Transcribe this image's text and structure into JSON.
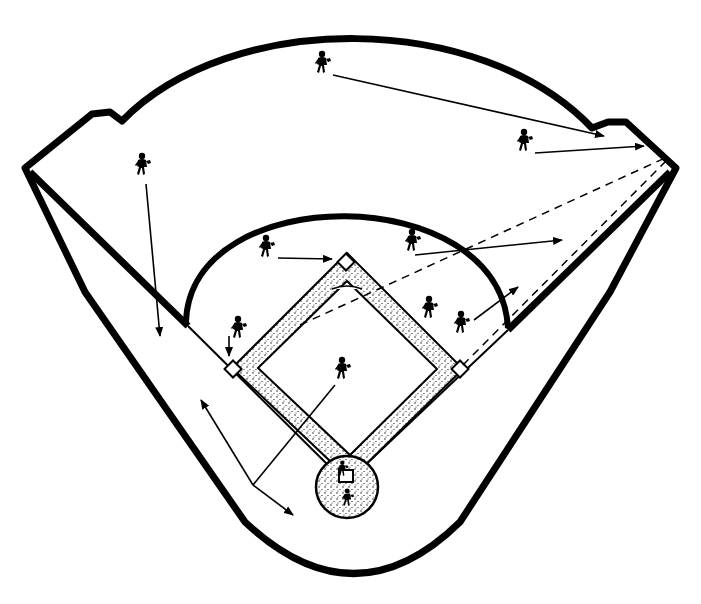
{
  "diagram": {
    "caption_fragment": "",
    "colors": {
      "ink": "#000000",
      "background": "#ffffff",
      "dirt_stipple": "#000000"
    }
  },
  "field": {
    "outfield_wall": "curved wall with notched corners at left and right field",
    "foul_lines": [
      "third-base line",
      "first-base line"
    ],
    "infield_arc": "grass/dirt boundary arc behind the bases",
    "bases": [
      "home plate",
      "first base",
      "second base",
      "third base"
    ],
    "pitchers_area": "stippled infield dirt with pitcher at center"
  },
  "players": [
    {
      "position": "center fielder",
      "x": 322,
      "y": 62
    },
    {
      "position": "right fielder",
      "x": 524,
      "y": 140
    },
    {
      "position": "left fielder",
      "x": 143,
      "y": 165
    },
    {
      "position": "shortstop",
      "x": 265,
      "y": 247
    },
    {
      "position": "second baseman",
      "x": 411,
      "y": 240
    },
    {
      "position": "third baseman",
      "x": 237,
      "y": 328
    },
    {
      "position": "runner",
      "x": 428,
      "y": 307
    },
    {
      "position": "first baseman",
      "x": 462,
      "y": 322
    },
    {
      "position": "pitcher",
      "x": 343,
      "y": 370
    },
    {
      "position": "catcher",
      "x": 343,
      "y": 465
    },
    {
      "position": "batter",
      "x": 347,
      "y": 497
    }
  ],
  "arrows": [
    {
      "from": "center fielder",
      "to": "right field corner",
      "style": "solid"
    },
    {
      "from": "right fielder",
      "to": "right field corner",
      "style": "solid"
    },
    {
      "from": "left fielder",
      "to": "left foul line",
      "style": "solid"
    },
    {
      "from": "shortstop",
      "to": "second base",
      "style": "solid"
    },
    {
      "from": "second baseman",
      "to": "right center",
      "style": "solid"
    },
    {
      "from": "first baseman",
      "to": "right field",
      "style": "solid"
    },
    {
      "from": "third baseman",
      "to": "third base",
      "style": "solid"
    },
    {
      "from": "pitcher",
      "to": "foul territory left",
      "style": "solid"
    },
    {
      "from": "home plate",
      "to": "right field corner",
      "style": "dashed"
    },
    {
      "from": "first base",
      "to": "right field corner",
      "style": "dashed"
    }
  ]
}
